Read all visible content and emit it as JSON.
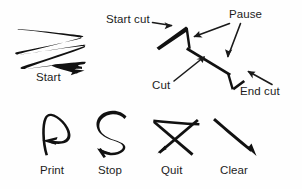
{
  "figure": {
    "background_color": "#fefefe",
    "ink_color": "#111111",
    "width": 302,
    "height": 189
  },
  "labels": {
    "start": "Start",
    "start_cut": "Start cut",
    "pause": "Pause",
    "cut": "Cut",
    "end_cut": "End cut",
    "print": "Print",
    "stop": "Stop",
    "quit": "Quit",
    "clear": "Clear"
  },
  "gestures": [
    {
      "id": "start",
      "name": "start-gesture",
      "label": "Start",
      "shape": "horizontal zigzag with three left-to-right strokes ending in an arrowhead"
    },
    {
      "id": "cut-sequence",
      "name": "cut-gesture",
      "label": "Cut",
      "shape": "jagged polyline annotated with start cut, pause, cut and end cut callouts"
    },
    {
      "id": "print",
      "name": "print-gesture",
      "label": "Print",
      "shape": "letter P drawn with a loop ending in a leftward arrowhead"
    },
    {
      "id": "stop",
      "name": "stop-gesture",
      "label": "Stop",
      "shape": "letter S ending in a leftward arrowhead"
    },
    {
      "id": "quit",
      "name": "quit-gesture",
      "label": "Quit",
      "shape": "horizontal bar crossed by an X with a down-left arrowhead"
    },
    {
      "id": "clear",
      "name": "clear-gesture",
      "label": "Clear",
      "shape": "single diagonal stroke down-right with an arrowhead"
    }
  ],
  "callouts": [
    {
      "id": "start-cut",
      "label": "Start cut",
      "points_to": "first vertex of the cut path"
    },
    {
      "id": "pause",
      "label": "Pause",
      "points_to": "second vertex of the cut path"
    },
    {
      "id": "cut",
      "label": "Cut",
      "points_to": "middle segment of the cut path"
    },
    {
      "id": "end-cut",
      "label": "End cut",
      "points_to": "final vertex of the cut path"
    }
  ]
}
